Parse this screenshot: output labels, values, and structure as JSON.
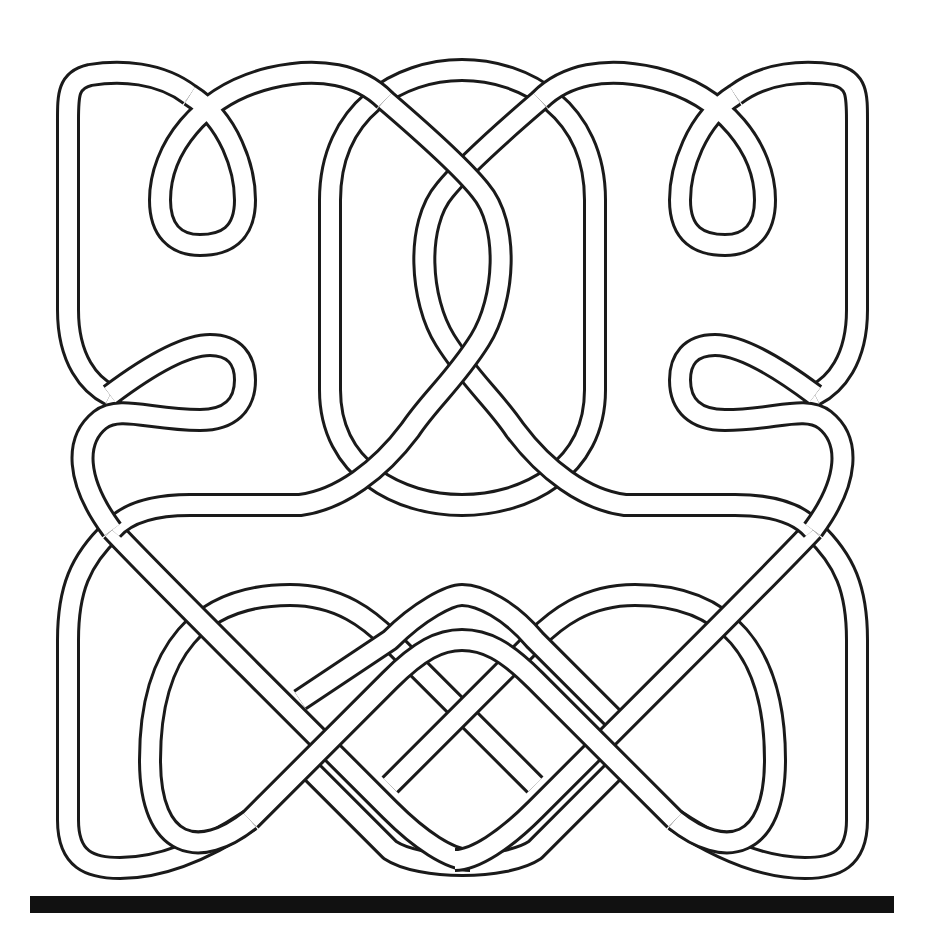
{
  "figure": {
    "title": "",
    "colors": {
      "background": "#ffffff",
      "outline": "#1a1a1a",
      "band_fill": "#ffffff",
      "base_bar": "#111111"
    },
    "parts": {
      "top_left_loops": 2,
      "top_right_loops": 2,
      "center_oval": 1,
      "center_twist": 1,
      "bottom_plait_loops": 3
    },
    "base_bar": {
      "x": 30,
      "y": 896,
      "width": 864,
      "height": 17
    }
  }
}
